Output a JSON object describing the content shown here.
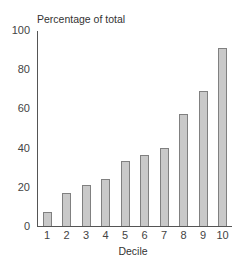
{
  "chart_data": {
    "type": "bar",
    "title": "",
    "xlabel": "Decile",
    "ylabel": "Percentage of total",
    "categories": [
      "1",
      "2",
      "3",
      "4",
      "5",
      "6",
      "7",
      "8",
      "9",
      "10"
    ],
    "values": [
      7,
      17,
      21,
      24,
      33,
      36,
      40,
      57,
      69,
      91
    ],
    "ylim": [
      0,
      100
    ],
    "yticks": [
      "0",
      "20",
      "40",
      "60",
      "80",
      "100"
    ],
    "grid": false,
    "legend": null,
    "colors": {
      "bar_fill": "#c9c9c9",
      "bar_border": "#808080",
      "axis": "#555555"
    }
  }
}
